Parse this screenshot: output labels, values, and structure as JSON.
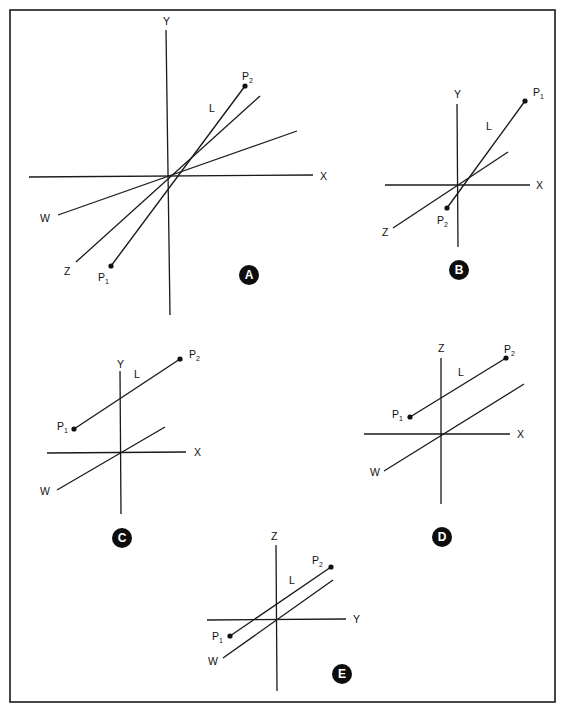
{
  "figure": {
    "frame": {
      "x": 10,
      "y": 10,
      "width": 545,
      "height": 692
    },
    "panels": [
      {
        "id": "A",
        "badge": {
          "label": "A",
          "cx": 249,
          "cy": 275
        },
        "axes": [
          {
            "name": "Y",
            "x1": 166,
            "y1": 30,
            "x2": 170,
            "y2": 315,
            "label_x": 163,
            "label_y": 25
          },
          {
            "name": "X",
            "x1": 29,
            "y1": 177,
            "x2": 313,
            "y2": 175,
            "label_x": 320,
            "label_y": 180
          },
          {
            "name": "W",
            "x1": 58,
            "y1": 215,
            "x2": 297,
            "y2": 131,
            "label_x": 40,
            "label_y": 222
          },
          {
            "name": "Z",
            "x1": 76,
            "y1": 262,
            "x2": 260,
            "y2": 96,
            "label_x": 64,
            "label_y": 275
          }
        ],
        "segment": {
          "name": "L",
          "x1": 111,
          "y1": 266,
          "x2": 245,
          "y2": 86,
          "label_x": 209,
          "label_y": 112
        },
        "points": [
          {
            "name": "P",
            "sub": "1",
            "x": 111,
            "y": 266,
            "label_x": 98,
            "label_y": 281
          },
          {
            "name": "P",
            "sub": "2",
            "x": 245,
            "y": 86,
            "label_x": 242,
            "label_y": 80
          }
        ]
      },
      {
        "id": "B",
        "badge": {
          "label": "B",
          "cx": 459,
          "cy": 270
        },
        "axes": [
          {
            "name": "Y",
            "x1": 457,
            "y1": 104,
            "x2": 458,
            "y2": 247,
            "label_x": 454,
            "label_y": 98
          },
          {
            "name": "X",
            "x1": 385,
            "y1": 185,
            "x2": 530,
            "y2": 185,
            "label_x": 536,
            "label_y": 189
          },
          {
            "name": "Z",
            "x1": 393,
            "y1": 228,
            "x2": 508,
            "y2": 152,
            "label_x": 382,
            "label_y": 236
          }
        ],
        "segment": {
          "name": "L",
          "x1": 447,
          "y1": 208,
          "x2": 525,
          "y2": 101,
          "label_x": 486,
          "label_y": 130
        },
        "points": [
          {
            "name": "P",
            "sub": "1",
            "x": 525,
            "y": 101,
            "label_x": 533,
            "label_y": 96
          },
          {
            "name": "P",
            "sub": "2",
            "x": 447,
            "y": 208,
            "label_x": 437,
            "label_y": 224
          }
        ]
      },
      {
        "id": "C",
        "badge": {
          "label": "C",
          "cx": 122,
          "cy": 538
        },
        "axes": [
          {
            "name": "Y",
            "x1": 120,
            "y1": 371,
            "x2": 121,
            "y2": 514,
            "label_x": 117,
            "label_y": 368
          },
          {
            "name": "X",
            "x1": 47,
            "y1": 453,
            "x2": 186,
            "y2": 452,
            "label_x": 194,
            "label_y": 456
          },
          {
            "name": "W",
            "x1": 57,
            "y1": 490,
            "x2": 165,
            "y2": 427,
            "label_x": 40,
            "label_y": 495
          }
        ],
        "segment": {
          "name": "L",
          "x1": 74,
          "y1": 429,
          "x2": 180,
          "y2": 359,
          "label_x": 134,
          "label_y": 378
        },
        "points": [
          {
            "name": "P",
            "sub": "1",
            "x": 74,
            "y": 429,
            "label_x": 57,
            "label_y": 430
          },
          {
            "name": "P",
            "sub": "2",
            "x": 180,
            "y": 359,
            "label_x": 189,
            "label_y": 358
          }
        ]
      },
      {
        "id": "D",
        "badge": {
          "label": "D",
          "cx": 442,
          "cy": 537
        },
        "axes": [
          {
            "name": "Z",
            "x1": 441,
            "y1": 358,
            "x2": 441,
            "y2": 504,
            "label_x": 438,
            "label_y": 352
          },
          {
            "name": "X",
            "x1": 364,
            "y1": 434,
            "x2": 510,
            "y2": 434,
            "label_x": 517,
            "label_y": 438
          },
          {
            "name": "W",
            "x1": 384,
            "y1": 471,
            "x2": 524,
            "y2": 384,
            "label_x": 370,
            "label_y": 476
          }
        ],
        "segment": {
          "name": "L",
          "x1": 410,
          "y1": 417,
          "x2": 506,
          "y2": 358,
          "label_x": 458,
          "label_y": 376
        },
        "points": [
          {
            "name": "P",
            "sub": "1",
            "x": 410,
            "y": 417,
            "label_x": 392,
            "label_y": 418
          },
          {
            "name": "P",
            "sub": "2",
            "x": 506,
            "y": 358,
            "label_x": 504,
            "label_y": 353
          }
        ]
      },
      {
        "id": "E",
        "badge": {
          "label": "E",
          "cx": 342,
          "cy": 674
        },
        "axes": [
          {
            "name": "Z",
            "x1": 276,
            "y1": 545,
            "x2": 277,
            "y2": 691,
            "label_x": 271,
            "label_y": 540
          },
          {
            "name": "Y",
            "x1": 207,
            "y1": 620,
            "x2": 346,
            "y2": 619,
            "label_x": 353,
            "label_y": 623
          },
          {
            "name": "W",
            "x1": 223,
            "y1": 658,
            "x2": 333,
            "y2": 580,
            "label_x": 208,
            "label_y": 665
          }
        ],
        "segment": {
          "name": "L",
          "x1": 230,
          "y1": 636,
          "x2": 331,
          "y2": 567,
          "label_x": 289,
          "label_y": 584
        },
        "points": [
          {
            "name": "P",
            "sub": "1",
            "x": 230,
            "y": 636,
            "label_x": 212,
            "label_y": 640
          },
          {
            "name": "P",
            "sub": "2",
            "x": 331,
            "y": 567,
            "label_x": 312,
            "label_y": 564
          }
        ]
      }
    ]
  }
}
